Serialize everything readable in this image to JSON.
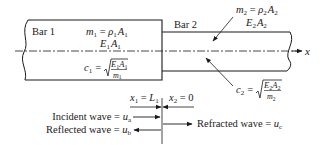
{
  "diagram": {
    "bar1": {
      "label": "Bar 1",
      "mass_eq": {
        "lhs": "m",
        "sub": "1",
        "eq": " = ",
        "rhs1": "ρ",
        "rhs1_sub": "1",
        "rhs2": "A",
        "rhs2_sub": "1"
      },
      "stiffness": {
        "a": "E",
        "a_sub": "1",
        "b": "A",
        "b_sub": "1"
      },
      "wave_speed": {
        "lhs": "c",
        "sub": "1",
        "eq": "=",
        "num_a": "E",
        "num_a_sub": "1",
        "num_b": "A",
        "num_b_sub": "1",
        "den": "m",
        "den_sub": "1"
      }
    },
    "bar2": {
      "label": "Bar 2",
      "mass_eq": {
        "lhs": "m",
        "sub": "2",
        "eq": " = ",
        "rhs1": "ρ",
        "rhs1_sub": "2",
        "rhs2": "A",
        "rhs2_sub": "2"
      },
      "stiffness": {
        "a": "E",
        "a_sub": "2",
        "b": "A",
        "b_sub": "2"
      },
      "wave_speed": {
        "lhs": "c",
        "sub": "2",
        "eq": "=",
        "num_a": "E",
        "num_a_sub": "2",
        "num_b": "A",
        "num_b_sub": "2",
        "den": "m",
        "den_sub": "2"
      }
    },
    "axis": {
      "label": "x"
    },
    "interface": {
      "left": {
        "var": "x",
        "sub": "1",
        "eq": " = ",
        "val": "L",
        "val_sub": "1"
      },
      "right": {
        "var": "x",
        "sub": "2",
        "eq": " = ",
        "val": "0"
      }
    },
    "waves": {
      "incident": {
        "text": "Incident wave = ",
        "var": "u",
        "sub": "a"
      },
      "reflected": {
        "text": "Reflected wave = ",
        "var": "u",
        "sub": "b"
      },
      "refracted": {
        "text": "Refracted wave = ",
        "var": "u",
        "sub": "c"
      }
    },
    "colors": {
      "ink": "#1a1a1a",
      "background": "#ffffff"
    }
  }
}
